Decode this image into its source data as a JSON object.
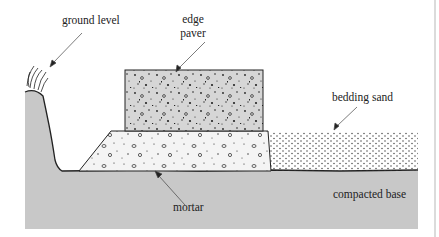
{
  "diagram": {
    "title": "",
    "labels": {
      "ground_level": "ground level",
      "edge_paver_line1": "edge",
      "edge_paver_line2": "paver",
      "bedding_sand": "bedding sand",
      "mortar": "mortar",
      "compacted_base": "compacted base"
    },
    "colors": {
      "base": "#c8c8c8",
      "paver": "#d6d6d6",
      "mortar": "#f4f4f4",
      "sand": "#ffffff",
      "outline": "#222222",
      "border": "#cfcfcf"
    },
    "layers": [
      {
        "name": "edge paver",
        "type": "block"
      },
      {
        "name": "mortar",
        "type": "trapezoid haunch"
      },
      {
        "name": "bedding sand",
        "type": "layer"
      },
      {
        "name": "compacted base",
        "type": "layer"
      },
      {
        "name": "ground level",
        "type": "grass bank"
      }
    ]
  }
}
